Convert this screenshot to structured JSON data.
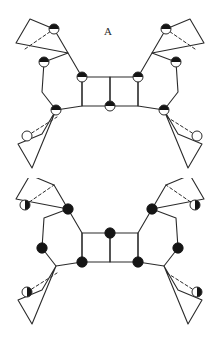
{
  "figure": {
    "background_color": "#ffffff",
    "ink_color": "#2b2b2b",
    "width": 224,
    "height": 356
  },
  "panels": [
    {
      "id": "A",
      "label": "A",
      "label_x": 112,
      "label_y": 32,
      "origin_y": 0,
      "description": "Butterfly-shaped cluster of edge-sharing four-membered rings with a central fused double square; half-shaded circles mark one atom type.",
      "atom_styles": {
        "half_filled": "circle with dark upper half",
        "open": "unfilled circle outline"
      },
      "bond_color": "#2b2b2b",
      "bond_width": 1.1,
      "dashed_bond_color": "#2b2b2b",
      "central_unit": {
        "shape": "two fused squares",
        "marked_vertices": [
          "top-left",
          "top-right",
          "bottom-middle"
        ]
      },
      "polygons": [
        {
          "name": "central-square-left",
          "points": "82,77 110,77 110,106 82,106"
        },
        {
          "name": "central-square-right",
          "points": "110,77 138,77 138,106 110,106"
        },
        {
          "name": "hexagon-left",
          "points": "82,77 68,53 44,62 42,92 56,110 82,106"
        },
        {
          "name": "hexagon-right",
          "points": "138,77 152,53 176,62 178,92 164,110 138,106"
        },
        {
          "name": "terminal-square-upper-left",
          "points": "68,53 54,29 30,19 16,43"
        },
        {
          "name": "terminal-square-lower-left",
          "points": "56,110 42,134 18,144 32,168"
        },
        {
          "name": "terminal-square-upper-right",
          "points": "152,53 166,29 190,19 204,43"
        },
        {
          "name": "terminal-square-lower-right",
          "points": "164,110 178,134 202,144 188,168"
        }
      ],
      "dashed_lines": [
        {
          "name": "dashed-upper-left",
          "x1": 25,
          "y1": 49,
          "x2": 54,
          "y2": 29
        },
        {
          "name": "dashed-lower-left",
          "x1": 27,
          "y1": 136,
          "x2": 57,
          "y2": 117
        },
        {
          "name": "dashed-upper-right",
          "x1": 195,
          "y1": 49,
          "x2": 166,
          "y2": 29
        },
        {
          "name": "dashed-lower-right",
          "x1": 197,
          "y1": 136,
          "x2": 167,
          "y2": 117
        }
      ],
      "atoms": [
        {
          "name": "atom-central-top-left",
          "x": 82,
          "y": 77,
          "r": 5.0,
          "style": "half_filled"
        },
        {
          "name": "atom-central-top-right",
          "x": 138,
          "y": 77,
          "r": 5.0,
          "style": "half_filled"
        },
        {
          "name": "atom-central-bottom-mid",
          "x": 110,
          "y": 106,
          "r": 5.0,
          "style": "half_filled"
        },
        {
          "name": "atom-hex-left-upper",
          "x": 44,
          "y": 62,
          "r": 5.0,
          "style": "half_filled"
        },
        {
          "name": "atom-hex-left-lower",
          "x": 56,
          "y": 110,
          "r": 5.0,
          "style": "half_filled"
        },
        {
          "name": "atom-hex-right-upper",
          "x": 176,
          "y": 62,
          "r": 5.0,
          "style": "half_filled"
        },
        {
          "name": "atom-hex-right-lower",
          "x": 164,
          "y": 110,
          "r": 5.0,
          "style": "half_filled"
        },
        {
          "name": "atom-terminal-upper-left",
          "x": 54,
          "y": 29,
          "r": 5.0,
          "style": "half_filled"
        },
        {
          "name": "atom-terminal-lower-left",
          "x": 27,
          "y": 136,
          "r": 5.0,
          "style": "open"
        },
        {
          "name": "atom-terminal-upper-right",
          "x": 166,
          "y": 29,
          "r": 5.0,
          "style": "half_filled"
        },
        {
          "name": "atom-terminal-lower-right",
          "x": 197,
          "y": 136,
          "r": 5.0,
          "style": "open"
        }
      ]
    },
    {
      "id": "B",
      "label": "B",
      "label_x": 113,
      "label_y": 207,
      "origin_y": 178,
      "description": "Same butterfly cluster topology as A but with the shading pattern inverted: solid filled circles at the ring junctions and the central square marked at the top-middle vertex.",
      "atom_styles": {
        "filled": "solid black circle",
        "half_filled": "circle with dark right half"
      },
      "bond_color": "#2b2b2b",
      "bond_width": 1.1,
      "dashed_bond_color": "#2b2b2b",
      "central_unit": {
        "shape": "two fused squares",
        "marked_vertices": [
          "top-middle",
          "bottom-left",
          "bottom-right"
        ]
      },
      "polygons": [
        {
          "name": "central-square-left",
          "points": "82,55 110,55 110,84 82,84"
        },
        {
          "name": "central-square-right",
          "points": "110,55 138,55 138,84 110,84"
        },
        {
          "name": "hexagon-left",
          "points": "82,55 68,31 44,40 42,70 56,88 82,84"
        },
        {
          "name": "hexagon-right",
          "points": "138,55 152,31 176,40 178,70 164,88 138,84"
        },
        {
          "name": "terminal-square-upper-left",
          "points": "68,31 54,7 30,-3 16,21"
        },
        {
          "name": "terminal-square-lower-left",
          "points": "56,88 42,112 18,122 32,146"
        },
        {
          "name": "terminal-square-upper-right",
          "points": "152,31 166,7 190,-3 204,21"
        },
        {
          "name": "terminal-square-lower-right",
          "points": "164,88 178,112 202,122 188,146"
        }
      ],
      "dashed_lines": [
        {
          "name": "dashed-upper-left",
          "x1": 25,
          "y1": 27,
          "x2": 54,
          "y2": 7
        },
        {
          "name": "dashed-lower-left",
          "x1": 27,
          "y1": 114,
          "x2": 57,
          "y2": 95
        },
        {
          "name": "dashed-upper-right",
          "x1": 195,
          "y1": 27,
          "x2": 166,
          "y2": 7
        },
        {
          "name": "dashed-lower-right",
          "x1": 197,
          "y1": 114,
          "x2": 167,
          "y2": 95
        }
      ],
      "atoms": [
        {
          "name": "atom-central-top-mid",
          "x": 110,
          "y": 55,
          "r": 5.2,
          "style": "filled"
        },
        {
          "name": "atom-central-bottom-left",
          "x": 82,
          "y": 84,
          "r": 5.2,
          "style": "filled"
        },
        {
          "name": "atom-central-bottom-right",
          "x": 138,
          "y": 84,
          "r": 5.2,
          "style": "filled"
        },
        {
          "name": "atom-hex-left-upper",
          "x": 68,
          "y": 31,
          "r": 5.2,
          "style": "filled"
        },
        {
          "name": "atom-hex-left-lower",
          "x": 42,
          "y": 70,
          "r": 5.2,
          "style": "filled"
        },
        {
          "name": "atom-hex-right-upper",
          "x": 152,
          "y": 31,
          "r": 5.2,
          "style": "filled"
        },
        {
          "name": "atom-hex-right-lower",
          "x": 178,
          "y": 70,
          "r": 5.2,
          "style": "filled"
        },
        {
          "name": "atom-terminal-upper-left",
          "x": 25,
          "y": 27,
          "r": 5.0,
          "style": "half_filled"
        },
        {
          "name": "atom-terminal-lower-left",
          "x": 27,
          "y": 114,
          "r": 5.0,
          "style": "half_filled"
        },
        {
          "name": "atom-terminal-upper-right",
          "x": 195,
          "y": 27,
          "r": 5.0,
          "style": "half_filled"
        },
        {
          "name": "atom-terminal-lower-right",
          "x": 197,
          "y": 114,
          "r": 5.0,
          "style": "half_filled"
        }
      ]
    }
  ]
}
